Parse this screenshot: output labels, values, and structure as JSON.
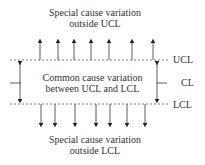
{
  "diagram": {
    "top_text": [
      "Special cause variation",
      "outside UCL"
    ],
    "middle_text": [
      "Common cause variation",
      "between UCL and LCL"
    ],
    "bottom_text": [
      "Special cause variation",
      "outside LCL"
    ],
    "labels": {
      "ucl": "UCL",
      "cl": "CL",
      "lcl": "LCL"
    },
    "up_arrows_x": [
      40,
      58,
      74,
      91,
      109,
      132,
      153
    ],
    "down_arrows_x": [
      41,
      55,
      75,
      96,
      110,
      127,
      145
    ],
    "line_color": "#333333"
  }
}
